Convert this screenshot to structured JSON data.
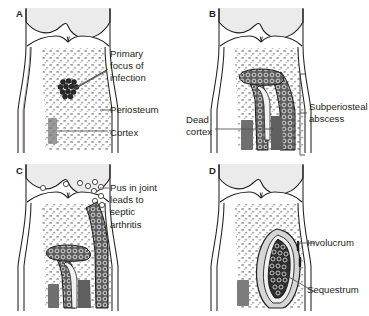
{
  "figure": {
    "panels": [
      {
        "letter": "A",
        "name": "panel-a",
        "callouts": [
          {
            "name": "primary-focus-of-infection",
            "text": "Primary\nfocus of\ninfection"
          },
          {
            "name": "periosteum",
            "text": "Periosteum"
          },
          {
            "name": "cortex",
            "text": "Cortex"
          }
        ]
      },
      {
        "letter": "B",
        "name": "panel-b",
        "callouts": [
          {
            "name": "dead-cortex",
            "text": "Dead\ncortex"
          },
          {
            "name": "subperiosteal-abscess",
            "text": "Subperiosteal\nabscess"
          }
        ]
      },
      {
        "letter": "C",
        "name": "panel-c",
        "callouts": [
          {
            "name": "pus-in-joint",
            "text": "Pus in joint\nleads to\nseptic\narthritis"
          }
        ]
      },
      {
        "letter": "D",
        "name": "panel-d",
        "callouts": [
          {
            "name": "involucrum",
            "text": "Involucrum"
          },
          {
            "name": "sequestrum",
            "text": "Sequestrum"
          }
        ]
      }
    ]
  },
  "colors": {
    "outline": "#231f20",
    "background": "#ffffff",
    "cartilage_fill": "#ebebeb",
    "marrow_fill": "#ffffff",
    "trabecular_stipple": "#8c8c8c",
    "dead_cortex_fill": "#6e6e6e",
    "abscess_fill": "#5a5a5a",
    "sequestrum_fill": "#3c3c3c",
    "involucrum_fill": "#d4d4d4",
    "leader_line": "#4d4d4d"
  }
}
